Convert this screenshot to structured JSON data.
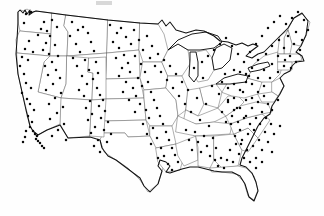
{
  "figure": {
    "type": "dot-distribution-map",
    "title": "",
    "region": "Contiguous United States",
    "background_color": "#ffffff",
    "national_outline_color": "#111111",
    "state_border_color": "#6d6d6d",
    "dot_color": "#0b0b0b",
    "dot_radius_px": 1.25,
    "width_px": 324,
    "height_px": 216,
    "legend": "",
    "annotations": []
  },
  "chart_data": {
    "type": "scatter",
    "title": "",
    "xlabel": "",
    "ylabel": "",
    "xlim": [
      0,
      324
    ],
    "ylim": [
      0,
      216
    ],
    "grid": false,
    "legend_position": "none",
    "series": [
      {
        "name": "Locations",
        "marker": "dot",
        "color": "#0b0b0b",
        "count": 268,
        "points": [
          [
            26,
            14
          ],
          [
            31,
            12
          ],
          [
            24,
            23
          ],
          [
            41,
            29
          ],
          [
            38,
            35
          ],
          [
            29,
            41
          ],
          [
            25,
            49
          ],
          [
            22,
            57
          ],
          [
            28,
            60
          ],
          [
            33,
            52
          ],
          [
            20,
            66
          ],
          [
            24,
            74
          ],
          [
            26,
            83
          ],
          [
            31,
            88
          ],
          [
            22,
            93
          ],
          [
            27,
            99
          ],
          [
            30,
            104
          ],
          [
            34,
            110
          ],
          [
            28,
            116
          ],
          [
            32,
            122
          ],
          [
            30,
            127
          ],
          [
            33,
            131
          ],
          [
            35,
            134
          ],
          [
            37,
            136
          ],
          [
            36,
            139
          ],
          [
            38,
            141
          ],
          [
            40,
            143
          ],
          [
            42,
            146
          ],
          [
            26,
            131
          ],
          [
            25,
            137
          ],
          [
            44,
            148
          ],
          [
            23,
            142
          ],
          [
            47,
            31
          ],
          [
            44,
            22
          ],
          [
            52,
            20
          ],
          [
            57,
            27
          ],
          [
            50,
            36
          ],
          [
            46,
            43
          ],
          [
            55,
            45
          ],
          [
            43,
            50
          ],
          [
            49,
            54
          ],
          [
            58,
            56
          ],
          [
            52,
            62
          ],
          [
            45,
            66
          ],
          [
            56,
            70
          ],
          [
            48,
            75
          ],
          [
            60,
            78
          ],
          [
            53,
            84
          ],
          [
            46,
            90
          ],
          [
            61,
            93
          ],
          [
            55,
            98
          ],
          [
            49,
            104
          ],
          [
            63,
            107
          ],
          [
            57,
            113
          ],
          [
            50,
            119
          ],
          [
            64,
            124
          ],
          [
            58,
            130
          ],
          [
            52,
            136
          ],
          [
            66,
            140
          ],
          [
            72,
            22
          ],
          [
            78,
            30
          ],
          [
            70,
            36
          ],
          [
            83,
            27
          ],
          [
            76,
            44
          ],
          [
            88,
            33
          ],
          [
            80,
            52
          ],
          [
            73,
            58
          ],
          [
            91,
            42
          ],
          [
            85,
            60
          ],
          [
            94,
            51
          ],
          [
            77,
            66
          ],
          [
            89,
            70
          ],
          [
            82,
            76
          ],
          [
            96,
            62
          ],
          [
            87,
            84
          ],
          [
            79,
            90
          ],
          [
            93,
            79
          ],
          [
            98,
            73
          ],
          [
            84,
            96
          ],
          [
            90,
            101
          ],
          [
            97,
            88
          ],
          [
            100,
            95
          ],
          [
            86,
            108
          ],
          [
            92,
            114
          ],
          [
            99,
            106
          ],
          [
            103,
            100
          ],
          [
            88,
            120
          ],
          [
            95,
            127
          ],
          [
            101,
            118
          ],
          [
            105,
            111
          ],
          [
            91,
            133
          ],
          [
            98,
            140
          ],
          [
            104,
            130
          ],
          [
            108,
            122
          ],
          [
            94,
            146
          ],
          [
            100,
            152
          ],
          [
            107,
            142
          ],
          [
            111,
            134
          ],
          [
            110,
            25
          ],
          [
            117,
            33
          ],
          [
            113,
            42
          ],
          [
            121,
            28
          ],
          [
            126,
            37
          ],
          [
            119,
            48
          ],
          [
            131,
            44
          ],
          [
            124,
            55
          ],
          [
            134,
            30
          ],
          [
            116,
            58
          ],
          [
            128,
            63
          ],
          [
            139,
            40
          ],
          [
            122,
            68
          ],
          [
            135,
            56
          ],
          [
            143,
            50
          ],
          [
            130,
            72
          ],
          [
            119,
            76
          ],
          [
            141,
            64
          ],
          [
            147,
            36
          ],
          [
            126,
            82
          ],
          [
            138,
            78
          ],
          [
            150,
            58
          ],
          [
            133,
            88
          ],
          [
            145,
            72
          ],
          [
            152,
            46
          ],
          [
            123,
            92
          ],
          [
            142,
            86
          ],
          [
            155,
            66
          ],
          [
            136,
            96
          ],
          [
            148,
            82
          ],
          [
            158,
            54
          ],
          [
            129,
            100
          ],
          [
            151,
            92
          ],
          [
            161,
            72
          ],
          [
            140,
            104
          ],
          [
            154,
            100
          ],
          [
            164,
            60
          ],
          [
            146,
            110
          ],
          [
            157,
            108
          ],
          [
            167,
            80
          ],
          [
            135,
            112
          ],
          [
            160,
            116
          ],
          [
            170,
            66
          ],
          [
            149,
            118
          ],
          [
            163,
            124
          ],
          [
            173,
            88
          ],
          [
            143,
            124
          ],
          [
            166,
            132
          ],
          [
            176,
            74
          ],
          [
            153,
            128
          ],
          [
            169,
            140
          ],
          [
            179,
            96
          ],
          [
            147,
            134
          ],
          [
            172,
            148
          ],
          [
            182,
            82
          ],
          [
            157,
            138
          ],
          [
            175,
            155
          ],
          [
            185,
            104
          ],
          [
            151,
            144
          ],
          [
            178,
            162
          ],
          [
            161,
            148
          ],
          [
            164,
            156
          ],
          [
            168,
            164
          ],
          [
            172,
            170
          ],
          [
            158,
            158
          ],
          [
            188,
            90
          ],
          [
            191,
            112
          ],
          [
            194,
            68
          ],
          [
            197,
            98
          ],
          [
            200,
            120
          ],
          [
            203,
            78
          ],
          [
            206,
            104
          ],
          [
            209,
            126
          ],
          [
            212,
            86
          ],
          [
            186,
            130
          ],
          [
            189,
            140
          ],
          [
            192,
            150
          ],
          [
            195,
            132
          ],
          [
            198,
            142
          ],
          [
            201,
            152
          ],
          [
            204,
            136
          ],
          [
            207,
            146
          ],
          [
            210,
            156
          ],
          [
            213,
            138
          ],
          [
            216,
            148
          ],
          [
            219,
            94
          ],
          [
            222,
            112
          ],
          [
            225,
            74
          ],
          [
            228,
            102
          ],
          [
            231,
            124
          ],
          [
            234,
            84
          ],
          [
            237,
            108
          ],
          [
            240,
            130
          ],
          [
            243,
            92
          ],
          [
            246,
            116
          ],
          [
            249,
            76
          ],
          [
            215,
            160
          ],
          [
            218,
            166
          ],
          [
            221,
            158
          ],
          [
            224,
            168
          ],
          [
            227,
            160
          ],
          [
            230,
            150
          ],
          [
            233,
            162
          ],
          [
            236,
            144
          ],
          [
            239,
            154
          ],
          [
            242,
            140
          ],
          [
            202,
            62
          ],
          [
            208,
            56
          ],
          [
            214,
            50
          ],
          [
            220,
            44
          ],
          [
            226,
            38
          ],
          [
            232,
            46
          ],
          [
            238,
            54
          ],
          [
            244,
            62
          ],
          [
            250,
            52
          ],
          [
            256,
            44
          ],
          [
            262,
            36
          ],
          [
            268,
            28
          ],
          [
            274,
            22
          ],
          [
            280,
            16
          ],
          [
            286,
            24
          ],
          [
            292,
            18
          ],
          [
            298,
            12
          ],
          [
            304,
            20
          ],
          [
            296,
            32
          ],
          [
            302,
            40
          ],
          [
            308,
            30
          ],
          [
            288,
            36
          ],
          [
            294,
            44
          ],
          [
            300,
            50
          ],
          [
            284,
            48
          ],
          [
            290,
            56
          ],
          [
            296,
            62
          ],
          [
            279,
            40
          ],
          [
            285,
            60
          ],
          [
            291,
            68
          ],
          [
            272,
            46
          ],
          [
            278,
            56
          ],
          [
            284,
            66
          ],
          [
            266,
            54
          ],
          [
            272,
            64
          ],
          [
            278,
            72
          ],
          [
            258,
            60
          ],
          [
            264,
            70
          ],
          [
            270,
            78
          ],
          [
            252,
            68
          ],
          [
            258,
            78
          ],
          [
            264,
            86
          ],
          [
            246,
            74
          ],
          [
            252,
            84
          ],
          [
            258,
            92
          ],
          [
            240,
            72
          ],
          [
            246,
            82
          ],
          [
            252,
            98
          ],
          [
            234,
            70
          ],
          [
            240,
            90
          ],
          [
            246,
            100
          ],
          [
            228,
            88
          ],
          [
            234,
            98
          ],
          [
            240,
            108
          ],
          [
            222,
            82
          ],
          [
            228,
            100
          ],
          [
            234,
            110
          ],
          [
            252,
            108
          ],
          [
            258,
            102
          ],
          [
            264,
            96
          ],
          [
            268,
            104
          ],
          [
            262,
            112
          ],
          [
            256,
            118
          ],
          [
            250,
            124
          ],
          [
            244,
            118
          ],
          [
            238,
            122
          ],
          [
            232,
            116
          ],
          [
            226,
            122
          ],
          [
            248,
            134
          ],
          [
            254,
            130
          ],
          [
            260,
            124
          ],
          [
            266,
            118
          ],
          [
            272,
            110
          ],
          [
            278,
            100
          ],
          [
            271,
            124
          ],
          [
            265,
            132
          ],
          [
            259,
            140
          ],
          [
            253,
            146
          ],
          [
            247,
            150
          ],
          [
            241,
            144
          ],
          [
            235,
            136
          ],
          [
            262,
            150
          ],
          [
            256,
            158
          ],
          [
            268,
            142
          ],
          [
            274,
            134
          ],
          [
            280,
            126
          ],
          [
            250,
            162
          ],
          [
            244,
            158
          ],
          [
            256,
            168
          ],
          [
            262,
            162
          ],
          [
            272,
            152
          ]
        ]
      }
    ]
  }
}
